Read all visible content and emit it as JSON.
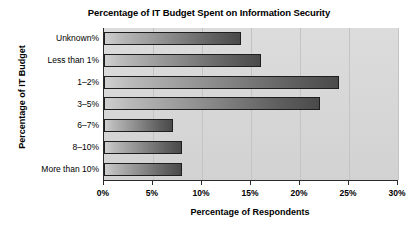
{
  "chart_data": {
    "type": "bar",
    "orientation": "horizontal",
    "title": "Percentage of IT Budget Spent on Information Security",
    "xlabel": "Percentage of Respondents",
    "ylabel": "Percentage of IT Budget",
    "categories": [
      "Unknown%",
      "Less than 1%",
      "1–2%",
      "3–5%",
      "6–7%",
      "8–10%",
      "More than 10%"
    ],
    "values": [
      14,
      16,
      24,
      22,
      7,
      8,
      8
    ],
    "xlim": [
      0,
      30
    ],
    "xticks": [
      0,
      5,
      10,
      15,
      20,
      25,
      30
    ],
    "xtick_labels": [
      "0%",
      "5%",
      "10%",
      "15%",
      "20%",
      "25%",
      "30%"
    ],
    "grid": true,
    "legend": false,
    "colors": {
      "plot_background": "#d8d8d8",
      "bar_light": "#cfcfcf",
      "bar_dark": "#4a4a4a",
      "bar_outline": "#1e1e1e",
      "axis": "#2a2a2a",
      "text": "#000000"
    }
  }
}
